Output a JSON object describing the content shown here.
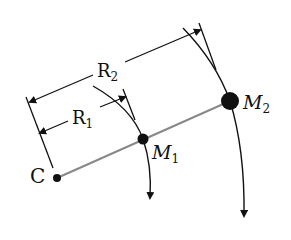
{
  "diagram": {
    "labels": {
      "center": "C",
      "mass1": "M",
      "mass1_sub": "1",
      "mass2": "M",
      "mass2_sub": "2",
      "radius1": "R",
      "radius1_sub": "1",
      "radius2": "R",
      "radius2_sub": "2"
    },
    "colors": {
      "ink": "#111111",
      "radial_line": "#888888",
      "background": "#ffffff"
    }
  }
}
